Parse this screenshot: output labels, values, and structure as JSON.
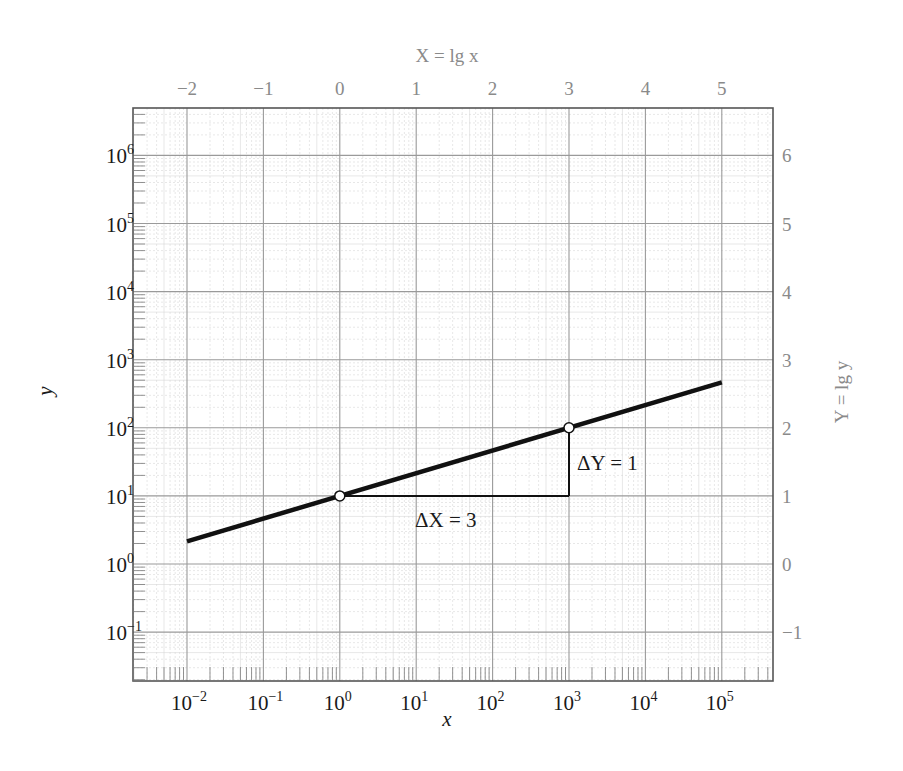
{
  "chart_data": {
    "type": "line",
    "title": "",
    "xlabel": "x",
    "ylabel": "y",
    "x_scale": "log",
    "y_scale": "log",
    "secondary_xlabel": "X = lg x",
    "secondary_ylabel": "Y = lg y",
    "xlim": [
      0.0023,
      500000
    ],
    "ylim": [
      0.021,
      5000000
    ],
    "x_ticks": [
      "10^-2",
      "10^-1",
      "10^0",
      "10^1",
      "10^2",
      "10^3",
      "10^4",
      "10^5"
    ],
    "y_ticks": [
      "10^-1",
      "10^0",
      "10^1",
      "10^2",
      "10^3",
      "10^4",
      "10^5",
      "10^6"
    ],
    "secondary_x_ticks": [
      "-2",
      "-1",
      "0",
      "1",
      "2",
      "3",
      "4",
      "5"
    ],
    "secondary_y_ticks": [
      "-1",
      "0",
      "1",
      "2",
      "3",
      "4",
      "5",
      "6"
    ],
    "grid": true,
    "series": [
      {
        "name": "y = 10 * x^(1/3)",
        "x": [
          0.01,
          1,
          1000,
          100000
        ],
        "y": [
          2.154,
          10,
          100,
          464.2
        ]
      }
    ],
    "marked_points": [
      {
        "x": 1,
        "y": 10
      },
      {
        "x": 1000,
        "y": 100
      }
    ],
    "annotations": [
      {
        "text": "ΔX = 3",
        "meaning": "horizontal leg from X=0 to X=3 at Y=1"
      },
      {
        "text": "ΔY = 1",
        "meaning": "vertical leg from Y=1 to Y=2 at X=3"
      }
    ]
  },
  "labels": {
    "bottom_title": "x",
    "left_title": "y",
    "top_title": "X = lg x",
    "right_title": "Y = lg y",
    "bottom_ticks": [
      {
        "base": "10",
        "exp": "−2"
      },
      {
        "base": "10",
        "exp": "−1"
      },
      {
        "base": "10",
        "exp": "0"
      },
      {
        "base": "10",
        "exp": "1"
      },
      {
        "base": "10",
        "exp": "2"
      },
      {
        "base": "10",
        "exp": "3"
      },
      {
        "base": "10",
        "exp": "4"
      },
      {
        "base": "10",
        "exp": "5"
      }
    ],
    "left_ticks": [
      {
        "base": "10",
        "exp": "6"
      },
      {
        "base": "10",
        "exp": "5"
      },
      {
        "base": "10",
        "exp": "4"
      },
      {
        "base": "10",
        "exp": "3"
      },
      {
        "base": "10",
        "exp": "2"
      },
      {
        "base": "10",
        "exp": "1"
      },
      {
        "base": "10",
        "exp": "0"
      },
      {
        "base": "10",
        "exp": "−1"
      }
    ],
    "top_ticks": [
      "−2",
      "−1",
      "0",
      "1",
      "2",
      "3",
      "4",
      "5"
    ],
    "right_ticks": [
      "6",
      "5",
      "4",
      "3",
      "2",
      "1",
      "0",
      "−1"
    ],
    "delta_x": "ΔX = 3",
    "delta_y": "ΔY = 1"
  },
  "colors": {
    "line": "#111111",
    "frame": "#555555",
    "major_grid": "#9a9a9a",
    "minor_grid": "#d6d6d6",
    "secondary_text": "#8a8a8a"
  }
}
